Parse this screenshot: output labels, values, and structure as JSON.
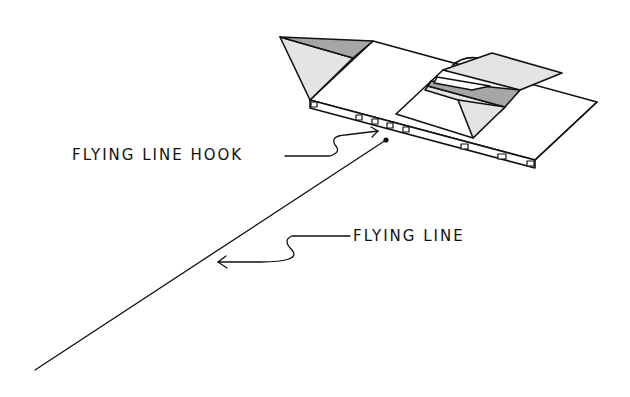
{
  "diagram": {
    "colors": {
      "ink": "#111111",
      "light_fill": "#e4e4e4",
      "dark_fill": "#a6a6a6",
      "background": "#ffffff"
    }
  },
  "labels": {
    "hook": "FLYING LINE HOOK",
    "line": "FLYING LINE"
  }
}
